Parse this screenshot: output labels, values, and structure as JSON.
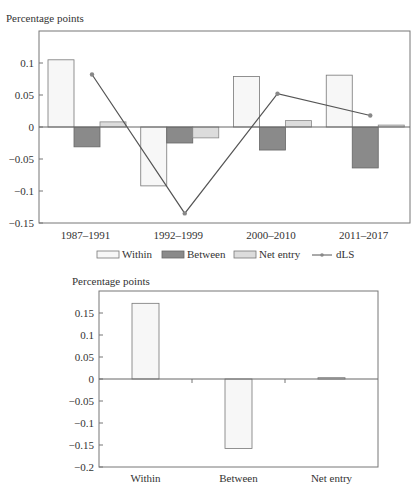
{
  "chart_data": [
    {
      "type": "bar",
      "ylabel": "Percentage points",
      "xlabel": "",
      "ylim": [
        -0.15,
        0.15
      ],
      "yticks": [
        -0.15,
        -0.1,
        -0.05,
        0,
        0.05,
        0.1
      ],
      "ytick_labels": [
        "−0.15",
        "−0.1",
        "−0.05",
        "0",
        "0.05",
        "0.1"
      ],
      "categories": [
        "1987–1991",
        "1992–1999",
        "2000–2010",
        "2011–2017"
      ],
      "series": [
        {
          "name": "Within",
          "kind": "bar",
          "color": "#f7f7f7",
          "values": [
            0.105,
            -0.092,
            0.079,
            0.081
          ]
        },
        {
          "name": "Between",
          "kind": "bar",
          "color": "#8a8a8a",
          "values": [
            -0.031,
            -0.025,
            -0.036,
            -0.064
          ]
        },
        {
          "name": "Net entry",
          "kind": "bar",
          "color": "#dcdcdc",
          "values": [
            0.008,
            -0.017,
            0.01,
            0.003
          ]
        },
        {
          "name": "dLS",
          "kind": "line",
          "color": "#555555",
          "values": [
            0.082,
            -0.135,
            0.052,
            0.018
          ]
        }
      ],
      "legend": {
        "position": "bottom",
        "entries": [
          "Within",
          "Between",
          "Net entry",
          "dLS"
        ]
      },
      "grid": false
    },
    {
      "type": "bar",
      "ylabel": "Percentage points",
      "xlabel": "",
      "ylim": [
        -0.2,
        0.2
      ],
      "yticks": [
        -0.2,
        -0.15,
        -0.1,
        -0.05,
        0,
        0.05,
        0.1,
        0.15
      ],
      "ytick_labels": [
        "−0.2",
        "−0.15",
        "−0.1",
        "−0.05",
        "0",
        "0.05",
        "0.1",
        "0.15"
      ],
      "categories": [
        "Within",
        "Between",
        "Net entry"
      ],
      "series": [
        {
          "name": "Contribution",
          "kind": "bar",
          "color": "#f7f7f7",
          "values": [
            0.172,
            -0.158,
            0.003
          ]
        }
      ],
      "grid": false
    }
  ]
}
